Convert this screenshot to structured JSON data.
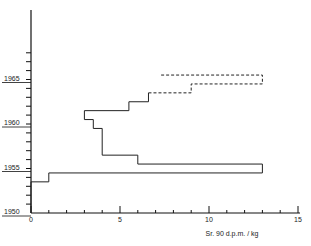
{
  "chart_data": {
    "type": "line",
    "subtype": "step",
    "title": "",
    "xlabel": "Sr. 90   d.p.m. / kg",
    "ylabel": "",
    "xlim": [
      0,
      15
    ],
    "ylim": [
      1950,
      1968
    ],
    "x_ticks": [
      "0",
      "5",
      "10",
      "15"
    ],
    "y_ticks": [
      "1950",
      "1955",
      "1960",
      "1965"
    ],
    "grid": false,
    "legend": null,
    "series": [
      {
        "name": "solid",
        "style": "solid",
        "points": [
          {
            "year_from": 1950,
            "year_to": 1953.5,
            "value": 0
          },
          {
            "year_from": 1953.5,
            "year_to": 1954.5,
            "value": 1
          },
          {
            "year_from": 1954.5,
            "year_to": 1955.5,
            "value": 13
          },
          {
            "year_from": 1955.5,
            "year_to": 1956.5,
            "value": 6
          },
          {
            "year_from": 1956.5,
            "year_to": 1959.5,
            "value": 4
          },
          {
            "year_from": 1959.5,
            "year_to": 1960.5,
            "value": 3.5
          },
          {
            "year_from": 1960.5,
            "year_to": 1961.5,
            "value": 3
          },
          {
            "year_from": 1961.5,
            "year_to": 1962.5,
            "value": 5.5
          },
          {
            "year_from": 1962.5,
            "year_to": 1963.5,
            "value": 6.6
          }
        ]
      },
      {
        "name": "dashed",
        "style": "dashed",
        "points": [
          {
            "year_from": 1963.5,
            "year_to": 1964.5,
            "value": 9
          },
          {
            "year_from": 1964.5,
            "year_to": 1965.5,
            "value": 13
          },
          {
            "year_from": 1965.5,
            "year_to": 1965.5,
            "value": 7.2
          }
        ]
      }
    ]
  }
}
